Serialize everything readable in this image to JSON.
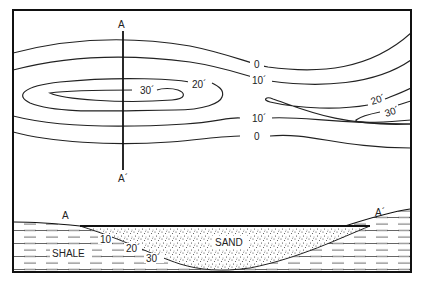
{
  "figure": {
    "type": "isopach map with cross-section",
    "colors": {
      "ink": "#1a1a1a",
      "background": "#ffffff"
    }
  },
  "map": {
    "section_line": {
      "start_label": "A",
      "end_label": "A´"
    },
    "contour_labels": {
      "left_inner": "30´",
      "left_outer": "20´",
      "upper_0": "0",
      "upper_10": "10´",
      "lower_10": "10´",
      "lower_0": "0",
      "right_20": "20´",
      "right_30": "30´"
    },
    "contours": [
      {
        "value": 0,
        "label": "0"
      },
      {
        "value": 10,
        "label": "10´"
      },
      {
        "value": 20,
        "label": "20´"
      },
      {
        "value": 30,
        "label": "30´"
      }
    ]
  },
  "cross_section": {
    "left_label": "A",
    "right_label": "A´",
    "units": [
      {
        "name": "SHALE",
        "pattern": "dashed"
      },
      {
        "name": "SAND",
        "pattern": "stippled"
      }
    ],
    "depth_labels": [
      "10",
      "20´",
      "30´"
    ]
  }
}
